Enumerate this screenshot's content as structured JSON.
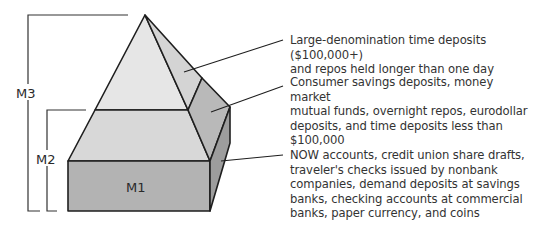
{
  "diagram": {
    "levels": [
      {
        "id": "M3",
        "label": "M3",
        "description": "Large-denomination time deposits ($100,000+)\nand repos held longer than one day"
      },
      {
        "id": "M2",
        "label": "M2",
        "description": "Consumer savings deposits, money market\nmutual funds, overnight repos, eurodollar\ndeposits, and time deposits less than $100,000"
      },
      {
        "id": "M1",
        "label": "M1",
        "description": "NOW accounts, credit union share drafts,\ntraveler's checks issued by nonbank\ncompanies, demand deposits at savings\nbanks, checking accounts at commercial\nbanks, paper currency, and coins"
      }
    ],
    "colors": {
      "top_front": "#e6e6e6",
      "top_side": "#d4d4d4",
      "mid_front": "#d8d8d8",
      "mid_side": "#b9b9b9",
      "box_front": "#b3b3b3",
      "box_side": "#9d9d9d",
      "stroke": "#1e1e1e"
    }
  }
}
